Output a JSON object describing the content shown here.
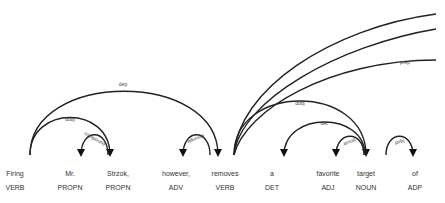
{
  "diagram": {
    "type": "dependency-parse",
    "tokens": [
      {
        "text": "Firing",
        "tag": "VERB",
        "x": 15
      },
      {
        "text": "Mr.",
        "tag": "PROPN",
        "x": 70
      },
      {
        "text": "Strzok,",
        "tag": "PROPN",
        "x": 118
      },
      {
        "text": "however,",
        "tag": "ADV",
        "x": 176
      },
      {
        "text": "removes",
        "tag": "VERB",
        "x": 225
      },
      {
        "text": "a",
        "tag": "DET",
        "x": 272
      },
      {
        "text": "favorite",
        "tag": "ADJ",
        "x": 328
      },
      {
        "text": "target",
        "tag": "NOUN",
        "x": 366
      },
      {
        "text": "of",
        "tag": "ADP",
        "x": 415
      }
    ],
    "arcs": [
      {
        "label": "dep",
        "from": "Firing",
        "to": "removes"
      },
      {
        "label": "dobj",
        "from": "Firing",
        "to": "Strzok,"
      },
      {
        "label": "compound",
        "from": "Strzok,",
        "to": "Mr."
      },
      {
        "label": "advmod",
        "from": "removes",
        "to": "however,"
      },
      {
        "label": "dobj",
        "from": "removes",
        "to": "target"
      },
      {
        "label": "det",
        "from": "target",
        "to": "a"
      },
      {
        "label": "amod",
        "from": "target",
        "to": "favorite"
      },
      {
        "label": "pobj",
        "from": "of",
        "to": "(off-screen right)"
      },
      {
        "label": "prep",
        "from": "removes",
        "to": "(off-screen right)"
      }
    ],
    "labels": {
      "dep": "dep",
      "dobj1": "dobj",
      "compound": "compound",
      "advmod": "advmod",
      "dobj2": "dobj",
      "det": "det",
      "amod": "amod",
      "pobj": "pobj",
      "prep": "prep"
    }
  }
}
